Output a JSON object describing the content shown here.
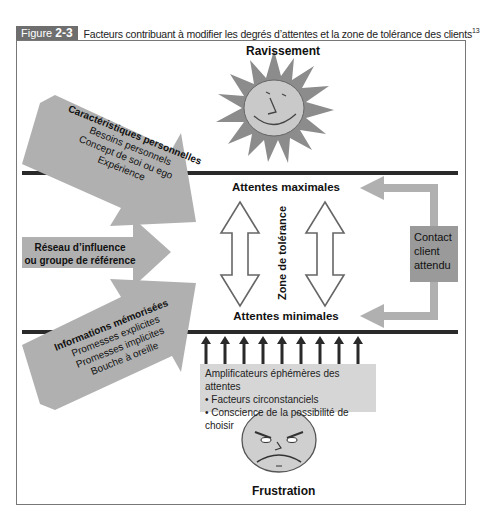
{
  "figure": {
    "label_prefix": "Figure",
    "label_number": "2-3",
    "title": "Facteurs contribuant à modifier les degrés d’attentes et la zone de tolérance des clients",
    "footnote_ref": "13"
  },
  "top": {
    "label": "Ravissement",
    "icon": "smiling-sun-icon"
  },
  "bottom": {
    "label": "Frustration",
    "icon": "angry-face-icon"
  },
  "center": {
    "max_label": "Attentes maximales",
    "min_label": "Attentes minimales",
    "zone_label": "Zone de tolérance"
  },
  "left_inputs": [
    {
      "title": "Caractéristiques personnelles",
      "items": [
        "Besoins personnels",
        "Concept de soi ou ego",
        "Expérience"
      ]
    },
    {
      "title_line1": "Réseau d’influence",
      "title_line2": "ou groupe de référence"
    },
    {
      "title": "Informations mémorisées",
      "items": [
        "Promesses explicites",
        "Promesses implicites",
        "Bouche à oreille"
      ]
    }
  ],
  "right_feedback": {
    "label_lines": [
      "Contact",
      "client",
      "attendu"
    ]
  },
  "amplifiers": {
    "title": "Amplificateurs éphémères des attentes",
    "items": [
      "• Facteurs circonstanciels",
      "• Conscience de la possibilité de choisir"
    ],
    "arrow_count": 9
  },
  "colors": {
    "arrow_fill": "#b0b0b0",
    "line": "#2a2a2a",
    "tag_bg": "#6e6e6e",
    "amp_box": "#d6d6d6",
    "contact_box": "#9a9a9a"
  }
}
